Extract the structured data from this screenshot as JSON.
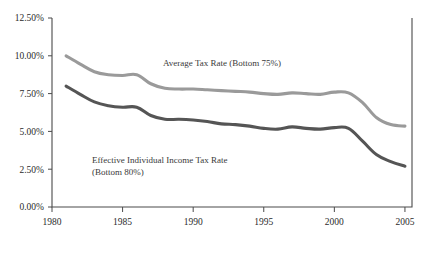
{
  "chart_data": {
    "type": "line",
    "title": "",
    "xlabel": "",
    "ylabel": "",
    "xlim": [
      1980,
      2005.5
    ],
    "ylim": [
      0,
      12.5
    ],
    "grid": false,
    "legend_position": "inline-annotations",
    "x_ticks": [
      "1980",
      "1985",
      "1990",
      "1995",
      "2000",
      "2005"
    ],
    "x_tick_values": [
      1980,
      1985,
      1990,
      1995,
      2000,
      2005
    ],
    "y_ticks": [
      "0.00%",
      "2.50%",
      "5.00%",
      "7.50%",
      "10.00%",
      "12.50%"
    ],
    "y_tick_values": [
      0,
      2.5,
      5.0,
      7.5,
      10.0,
      12.5
    ],
    "x": [
      1981,
      1982,
      1983,
      1984,
      1985,
      1986,
      1987,
      1988,
      1989,
      1990,
      1991,
      1992,
      1993,
      1994,
      1995,
      1996,
      1997,
      1998,
      1999,
      2000,
      2001,
      2002,
      2003,
      2004,
      2005
    ],
    "series": [
      {
        "name": "Average Tax Rate (Bottom 75%)",
        "color": "#9a9a9a",
        "values": [
          10.0,
          9.45,
          8.95,
          8.75,
          8.7,
          8.75,
          8.15,
          7.85,
          7.8,
          7.8,
          7.75,
          7.7,
          7.65,
          7.6,
          7.5,
          7.45,
          7.55,
          7.5,
          7.45,
          7.6,
          7.55,
          6.9,
          5.9,
          5.45,
          5.35
        ]
      },
      {
        "name": "Effective Individual Income Tax Rate (Bottom 80%)",
        "color": "#555555",
        "values": [
          8.0,
          7.45,
          6.95,
          6.7,
          6.6,
          6.6,
          6.05,
          5.8,
          5.8,
          5.75,
          5.65,
          5.5,
          5.45,
          5.35,
          5.2,
          5.15,
          5.3,
          5.2,
          5.15,
          5.25,
          5.2,
          4.35,
          3.45,
          3.0,
          2.7
        ]
      }
    ],
    "annotations": [
      {
        "name": "average-tax-rate-label",
        "lines": [
          "Average Tax Rate (Bottom 75%)"
        ],
        "x_px": 163,
        "y_px": 66
      },
      {
        "name": "effective-income-tax-rate-label",
        "lines": [
          "Effective Individual Income Tax Rate",
          "(Bottom 80%)"
        ],
        "x_px": 92,
        "y_px": 163
      }
    ]
  }
}
